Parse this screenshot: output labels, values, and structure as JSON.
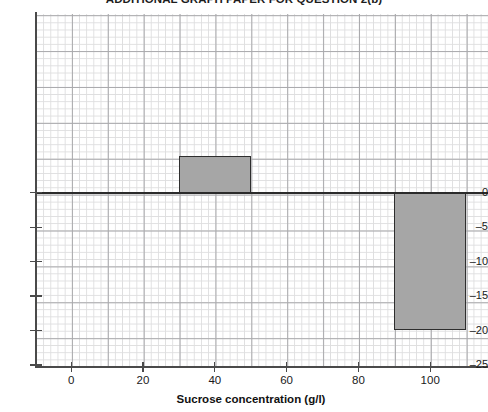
{
  "title": "ADDITIONAL GRAPH PAPER FOR QUESTION 2(b)",
  "axis": {
    "x_title": "Sucrose concentration (g/l)",
    "y_title": ""
  },
  "chart_data": {
    "type": "bar",
    "title": "ADDITIONAL GRAPH PAPER FOR QUESTION 2(b)",
    "xlabel": "Sucrose concentration (g/l)",
    "ylabel": "",
    "xlim": [
      -10,
      116
    ],
    "ylim": [
      -25,
      26
    ],
    "grid": true,
    "legend": "none",
    "x_ticks": [
      0,
      20,
      40,
      60,
      80,
      100
    ],
    "x_tick_labels": [
      "0",
      "20",
      "40",
      "60",
      "80",
      "100"
    ],
    "y_ticks": [
      0,
      -5,
      -10,
      -15,
      -20,
      -25
    ],
    "y_tick_labels": [
      "0",
      "–5",
      "–10",
      "–15",
      "–20",
      "–25"
    ],
    "minor_grid_x_step": 2,
    "minor_grid_y_step": 1,
    "major_grid_x_step": 10,
    "major_grid_y_step": 5,
    "bar_fill_color": "#a6a6a6",
    "bar_edge_color": "#2e2e2e",
    "bars": [
      {
        "label": "30-50",
        "x_start": 30,
        "x_end": 50,
        "value": 5.3
      },
      {
        "label": "90-110",
        "x_start": 90,
        "x_end": 110,
        "value": -20.0
      }
    ]
  },
  "y_axis_labels": [
    "0",
    "–5",
    "–10",
    "–15",
    "–20",
    "–25"
  ],
  "x_axis_labels": [
    "0",
    "20",
    "40",
    "60",
    "80",
    "100"
  ]
}
